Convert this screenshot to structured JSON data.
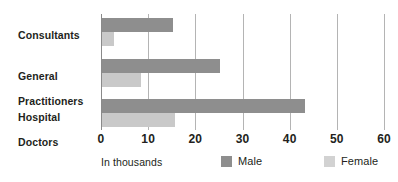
{
  "chart_data": {
    "type": "bar",
    "orientation": "horizontal",
    "title": "",
    "subtitle": "",
    "xlabel": "In thousands",
    "ylabel": "",
    "categories": [
      "Consultants",
      "General Practitioners",
      "Hospital Doctors"
    ],
    "category_label_lines": [
      [
        "Consultants"
      ],
      [
        "General",
        "Practitioners"
      ],
      [
        "Hospital",
        "Doctors"
      ]
    ],
    "series": [
      {
        "name": "Male",
        "color": "#8e8e8e",
        "values": [
          15.2,
          25.3,
          43.2
        ]
      },
      {
        "name": "Female",
        "color": "#c9c9c9",
        "values": [
          2.7,
          8.5,
          15.7
        ]
      }
    ],
    "xlim": [
      0,
      60
    ],
    "xticks": [
      0,
      10,
      20,
      30,
      40,
      50,
      60
    ],
    "xtick_labels": [
      "0",
      "10",
      "20",
      "30",
      "40",
      "50",
      "60"
    ],
    "grid": true,
    "grid_axis": "x",
    "legend_position": "bottom",
    "legend": [
      {
        "label": "Male",
        "color": "#8e8e8e"
      },
      {
        "label": "Female",
        "color": "#d2d2d2"
      }
    ]
  },
  "axis": {
    "caption": "In thousands"
  },
  "colors": {
    "male": "#8e8e8e",
    "female": "#c9c9c9",
    "gridline": "#b4b4b4",
    "axis": "#8a8a8a",
    "text": "#231f20",
    "background": "#ffffff"
  }
}
